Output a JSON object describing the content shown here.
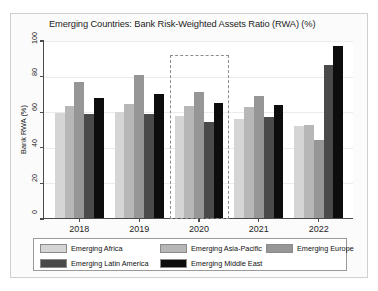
{
  "chart_data": {
    "type": "bar",
    "title": "Emerging Countries: Bank Risk-Weighted Assets Ratio (RWA) (%)",
    "xlabel": "",
    "ylabel": "Bank RWA (%)",
    "ylim": [
      0,
      100
    ],
    "yticks": [
      0,
      20,
      40,
      60,
      80,
      100
    ],
    "ytick_labels": [
      "0",
      "20",
      "40",
      "60",
      "80",
      "100"
    ],
    "grid": true,
    "legend_position": "bottom",
    "categories": [
      "2018",
      "2019",
      "2020",
      "2021",
      "2022"
    ],
    "series": [
      {
        "name": "Emerging Africa",
        "color": "#d5d5d5",
        "values": [
          58.8,
          59.5,
          57.3,
          55.7,
          51.5
        ]
      },
      {
        "name": "Emerging Asia-Pacific",
        "color": "#b7b7b7",
        "values": [
          63.2,
          63.8,
          62.7,
          62.5,
          52.0
        ]
      },
      {
        "name": "Emerging Europe",
        "color": "#969696",
        "values": [
          76.2,
          80.6,
          70.6,
          68.7,
          43.8
        ]
      },
      {
        "name": "Emerging Latin America",
        "color": "#4a4a4a",
        "values": [
          58.3,
          58.5,
          54.2,
          57.0,
          86.1
        ]
      },
      {
        "name": "Emerging Middle East",
        "color": "#0d0d0d",
        "values": [
          67.6,
          69.5,
          64.6,
          63.7,
          96.7
        ]
      }
    ],
    "annotations": [
      {
        "name": "highlight-box-2020",
        "category": "2020",
        "style": "dashed-rectangle",
        "color": "#8d8d8d"
      }
    ]
  },
  "legend": {
    "rows": [
      [
        "Emerging Africa",
        "Emerging Asia-Pacific",
        "Emerging Europe"
      ],
      [
        "Emerging Latin America",
        "Emerging Middle East"
      ]
    ]
  }
}
